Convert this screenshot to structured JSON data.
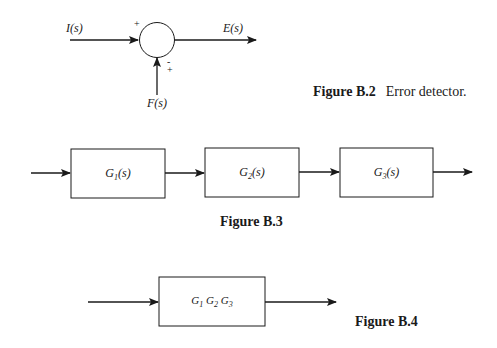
{
  "figure_b2": {
    "input_label": "I(s)",
    "output_label": "E(s)",
    "feedback_label": "F(s)",
    "top_sign": "+",
    "bottom_sign_top": "-",
    "bottom_sign_bottom": "+",
    "caption_number": "Figure B.2",
    "caption_text": "Error detector."
  },
  "figure_b3": {
    "blocks": [
      {
        "name": "G",
        "sub": "1",
        "arg": "(s)"
      },
      {
        "name": "G",
        "sub": "2",
        "arg": "(s)"
      },
      {
        "name": "G",
        "sub": "3",
        "arg": "(s)"
      }
    ],
    "caption_number": "Figure B.3"
  },
  "figure_b4": {
    "block": {
      "g1": "G",
      "s1": "1",
      "g2": "G",
      "s2": "2",
      "g3": "G",
      "s3": "3"
    },
    "caption_number": "Figure B.4"
  }
}
